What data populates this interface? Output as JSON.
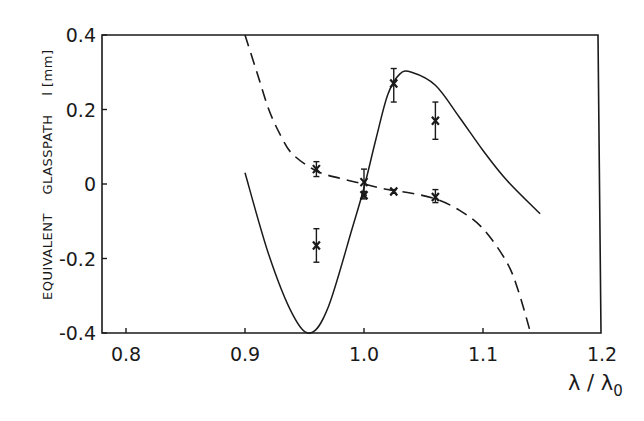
{
  "chart_data": {
    "type": "line",
    "title": "",
    "xlabel": "λ/λ0",
    "ylabel": "EQUIVALENT GLASSPATH l [mm]",
    "xlim": [
      0.78,
      1.2
    ],
    "ylim": [
      -0.4,
      0.4
    ],
    "grid": false,
    "legend": null,
    "x_ticks": [
      0.8,
      0.9,
      1.0,
      1.1,
      1.2
    ],
    "x_tick_labels": [
      "0.8",
      "0.9",
      "1.0",
      "1.1",
      "1.2"
    ],
    "y_ticks": [
      0.4,
      0.2,
      0,
      -0.2,
      -0.4
    ],
    "y_tick_labels": [
      "0.4",
      "0.2",
      "0",
      "-0.2",
      "-0.4"
    ],
    "series": [
      {
        "name": "solid curve",
        "style": "solid",
        "x": [
          0.9,
          0.92,
          0.94,
          0.955,
          0.97,
          0.99,
          1.0,
          1.01,
          1.02,
          1.03,
          1.04,
          1.06,
          1.08,
          1.1,
          1.12,
          1.148
        ],
        "y": [
          0.03,
          -0.19,
          -0.35,
          -0.4,
          -0.33,
          -0.12,
          -0.01,
          0.12,
          0.24,
          0.295,
          0.3,
          0.265,
          0.18,
          0.09,
          0.01,
          -0.08
        ]
      },
      {
        "name": "dashed curve",
        "style": "dashed",
        "x": [
          0.9,
          0.91,
          0.92,
          0.93,
          0.94,
          0.96,
          0.98,
          1.0,
          1.02,
          1.04,
          1.06,
          1.08,
          1.1,
          1.12,
          1.13,
          1.14
        ],
        "y": [
          0.4,
          0.3,
          0.2,
          0.13,
          0.08,
          0.035,
          0.015,
          0.0,
          -0.015,
          -0.025,
          -0.04,
          -0.07,
          -0.12,
          -0.21,
          -0.29,
          -0.4
        ]
      },
      {
        "name": "measurements",
        "style": "points-with-errorbars",
        "points": [
          {
            "x": 0.96,
            "y": 0.04,
            "err_low": 0.02,
            "err_high": 0.06
          },
          {
            "x": 0.96,
            "y": -0.165,
            "err_low": -0.21,
            "err_high": -0.12
          },
          {
            "x": 1.0,
            "y": 0.005,
            "err_low": -0.03,
            "err_high": 0.04
          },
          {
            "x": 1.0,
            "y": -0.03,
            "err_low": -0.04,
            "err_high": -0.02
          },
          {
            "x": 1.025,
            "y": 0.27,
            "err_low": 0.22,
            "err_high": 0.31
          },
          {
            "x": 1.025,
            "y": -0.02,
            "err_low": -0.025,
            "err_high": -0.015
          },
          {
            "x": 1.06,
            "y": 0.17,
            "err_low": 0.12,
            "err_high": 0.22
          },
          {
            "x": 1.06,
            "y": -0.035,
            "err_low": -0.05,
            "err_high": -0.015
          }
        ]
      }
    ]
  },
  "axes": {
    "ylabel_words": [
      "EQUIVALENT",
      "GLASSPATH",
      "l [mm]"
    ],
    "xlabel_main": "λ / λ",
    "xlabel_sub": "0"
  },
  "colors": {
    "ink": "#1a1a1a",
    "background": "#ffffff"
  }
}
